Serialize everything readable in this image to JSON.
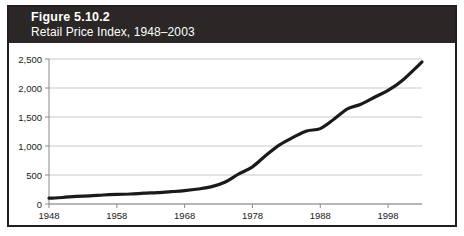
{
  "figure": {
    "title": "Figure 5.10.2",
    "subtitle": "Retail Price Index, 1948–2003"
  },
  "colors": {
    "header_background": "#2b2726",
    "header_text": "#ffffff",
    "frame_border": "#231f20",
    "plot_background": "#ffffff",
    "gridline": "#c9c9c9",
    "axis": "#8a8a8a",
    "series_line": "#1a1a1a",
    "tick_text": "#1a1a1a"
  },
  "chart_data": {
    "type": "line",
    "title": "Figure 5.10.2",
    "subtitle": "Retail Price Index, 1948–2003",
    "xlabel": "",
    "ylabel": "",
    "xlim": [
      1948,
      2003
    ],
    "ylim": [
      0,
      2500
    ],
    "grid": true,
    "legend": "none",
    "x_ticks": [
      1948,
      1958,
      1968,
      1978,
      1988,
      1998
    ],
    "x_tick_labels": [
      "1948",
      "1958",
      "1968",
      "1978",
      "1988",
      "1998"
    ],
    "y_ticks": [
      0,
      500,
      1000,
      1500,
      2000,
      2500
    ],
    "y_tick_labels": [
      "0",
      "500",
      "1,000",
      "1,500",
      "2,000",
      "2,500"
    ],
    "series": [
      {
        "name": "Retail Price Index",
        "x": [
          1948,
          1950,
          1952,
          1954,
          1956,
          1958,
          1960,
          1962,
          1964,
          1966,
          1968,
          1970,
          1972,
          1974,
          1976,
          1978,
          1980,
          1982,
          1984,
          1986,
          1988,
          1990,
          1992,
          1994,
          1996,
          1998,
          2000,
          2003
        ],
        "values": [
          100,
          112,
          133,
          140,
          155,
          165,
          172,
          186,
          196,
          212,
          230,
          258,
          300,
          380,
          520,
          640,
          840,
          1020,
          1150,
          1260,
          1300,
          1460,
          1640,
          1720,
          1840,
          1960,
          2120,
          2450
        ]
      }
    ]
  }
}
